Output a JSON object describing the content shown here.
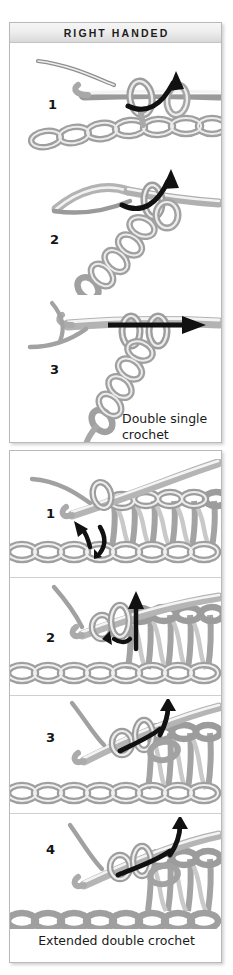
{
  "header": {
    "title": "RIGHT HANDED"
  },
  "panels": [
    {
      "id": "right-handed",
      "caption": "Double single\ncrochet",
      "caption_line1": "Double single",
      "caption_line2": "crochet",
      "steps": [
        {
          "number": "1"
        },
        {
          "number": "2"
        },
        {
          "number": "3"
        }
      ]
    },
    {
      "id": "extended",
      "caption": "Extended double crochet",
      "steps": [
        {
          "number": "1"
        },
        {
          "number": "2"
        },
        {
          "number": "3"
        },
        {
          "number": "4"
        }
      ]
    }
  ],
  "colors": {
    "yarn_light": "#f2f2f2",
    "yarn_mid": "#c9c9c9",
    "yarn_dark": "#8e8e8e",
    "yarn_outline": "#6f6f6f",
    "arrow": "#111111",
    "panel_border": "#b9b9b9",
    "header_text": "#1c1c1c",
    "caption_text": "#1a1a1a",
    "background": "#ffffff"
  },
  "icons": {
    "arrow": "arrow-icon",
    "hook": "crochet-hook-icon",
    "yarn": "yarn-loop-icon"
  }
}
